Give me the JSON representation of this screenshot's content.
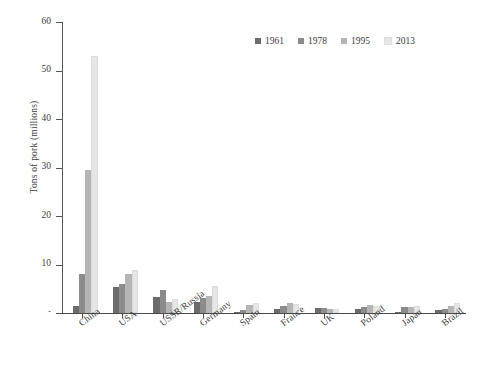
{
  "chart_data": {
    "type": "bar",
    "title": "",
    "xlabel": "",
    "ylabel": "Tons of pork (millions)",
    "ylim": [
      0,
      60
    ],
    "yticks": [
      0,
      10,
      20,
      30,
      40,
      50,
      60
    ],
    "ytick_labels": [
      "-",
      "10",
      "20",
      "30",
      "40",
      "50",
      "60"
    ],
    "grid": false,
    "legend_position": "top-right",
    "categories": [
      "China",
      "USA",
      "USSR/Russia",
      "Germany",
      "Spain",
      "France",
      "UK",
      "Poland",
      "Japan",
      "Brazil"
    ],
    "series": [
      {
        "name": "1961",
        "color": "#6b6b6b",
        "values": [
          1.5,
          5.3,
          3.3,
          2.3,
          0.2,
          0.9,
          1.0,
          0.8,
          0.2,
          0.6
        ]
      },
      {
        "name": "1978",
        "color": "#8c8c8c",
        "values": [
          8.0,
          6.0,
          4.7,
          3.0,
          0.6,
          1.5,
          1.0,
          1.3,
          1.3,
          0.9
        ]
      },
      {
        "name": "1995",
        "color": "#b5b5b5",
        "values": [
          29.5,
          8.1,
          2.2,
          3.6,
          1.6,
          2.1,
          0.9,
          1.7,
          1.3,
          1.4
        ]
      },
      {
        "name": "2013",
        "color": "#e6e6e6",
        "values": [
          53.0,
          8.8,
          2.8,
          5.5,
          2.1,
          1.9,
          0.8,
          1.5,
          1.4,
          2.1
        ]
      }
    ]
  },
  "legend": {
    "items": [
      {
        "label": "1961",
        "color": "#6b6b6b"
      },
      {
        "label": "1978",
        "color": "#8c8c8c"
      },
      {
        "label": "1995",
        "color": "#b5b5b5"
      },
      {
        "label": "2013",
        "color": "#e6e6e6"
      }
    ]
  },
  "axis": {
    "y_title": "Tons of pork (millions)"
  },
  "colors": {
    "background": "#ffffff",
    "axis": "#4a4a4a",
    "text": "#3c3c3c"
  }
}
